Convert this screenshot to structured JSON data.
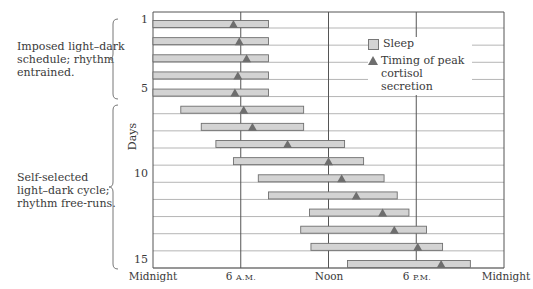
{
  "annotations": {
    "imposed": [
      "Imposed light–dark",
      "schedule; rhythm",
      "entrained."
    ],
    "self_selected": [
      "Self-selected",
      "light–dark cycle;",
      "rhythm free-runs."
    ]
  },
  "axis": {
    "ylabel": "Days",
    "day_ticks": [
      "1",
      "5",
      "10",
      "15"
    ],
    "x_ticks": [
      {
        "main": "Midnight",
        "small": ""
      },
      {
        "main": "6 ",
        "small": "A.M."
      },
      {
        "main": "Noon",
        "small": ""
      },
      {
        "main": "6 ",
        "small": "P.M."
      },
      {
        "main": "Midnight",
        "small": ""
      }
    ]
  },
  "legend": {
    "sleep": "Sleep",
    "cortisol_line1": "Timing of peak",
    "cortisol_line2": "cortisol secretion"
  },
  "colors": {
    "bar_fill": "#d3d3d3",
    "bar_stroke": "#6f6f6f",
    "triangle": "#6e6e6e",
    "grid": "#b5b5b5",
    "axis": "#555555"
  },
  "chart_data": {
    "type": "gantt",
    "title": "",
    "xlabel": "Time of day",
    "ylabel": "Days",
    "x_range_hours": [
      0,
      24
    ],
    "x_ticks": [
      "Midnight",
      "6 A.M.",
      "Noon",
      "6 P.M.",
      "Midnight"
    ],
    "y_range_days": [
      1,
      15
    ],
    "legend": [
      "Sleep",
      "Timing of peak cortisol secretion"
    ],
    "phases": [
      {
        "label": "Imposed light–dark schedule; rhythm entrained.",
        "days": [
          1,
          5
        ]
      },
      {
        "label": "Self-selected light–dark cycle; rhythm free-runs.",
        "days": [
          6,
          15
        ]
      }
    ],
    "series": [
      {
        "day": 1,
        "sleep_start": 0.0,
        "sleep_end": 7.9,
        "cortisol_peak": 5.5
      },
      {
        "day": 2,
        "sleep_start": 0.0,
        "sleep_end": 7.9,
        "cortisol_peak": 5.9
      },
      {
        "day": 3,
        "sleep_start": 0.0,
        "sleep_end": 7.9,
        "cortisol_peak": 6.4
      },
      {
        "day": 4,
        "sleep_start": 0.0,
        "sleep_end": 7.9,
        "cortisol_peak": 5.8
      },
      {
        "day": 5,
        "sleep_start": 0.0,
        "sleep_end": 7.9,
        "cortisol_peak": 5.6
      },
      {
        "day": 6,
        "sleep_start": 1.9,
        "sleep_end": 10.3,
        "cortisol_peak": 6.2
      },
      {
        "day": 7,
        "sleep_start": 3.3,
        "sleep_end": 10.3,
        "cortisol_peak": 6.8
      },
      {
        "day": 8,
        "sleep_start": 4.3,
        "sleep_end": 13.1,
        "cortisol_peak": 9.2
      },
      {
        "day": 9,
        "sleep_start": 5.5,
        "sleep_end": 14.4,
        "cortisol_peak": 12.0
      },
      {
        "day": 10,
        "sleep_start": 7.2,
        "sleep_end": 15.8,
        "cortisol_peak": 12.9
      },
      {
        "day": 11,
        "sleep_start": 7.9,
        "sleep_end": 16.7,
        "cortisol_peak": 13.9
      },
      {
        "day": 12,
        "sleep_start": 10.7,
        "sleep_end": 17.5,
        "cortisol_peak": 15.7
      },
      {
        "day": 13,
        "sleep_start": 10.1,
        "sleep_end": 18.7,
        "cortisol_peak": 16.5
      },
      {
        "day": 14,
        "sleep_start": 10.8,
        "sleep_end": 19.8,
        "cortisol_peak": 18.1
      },
      {
        "day": 15,
        "sleep_start": 13.3,
        "sleep_end": 21.7,
        "cortisol_peak": 19.7
      }
    ]
  }
}
